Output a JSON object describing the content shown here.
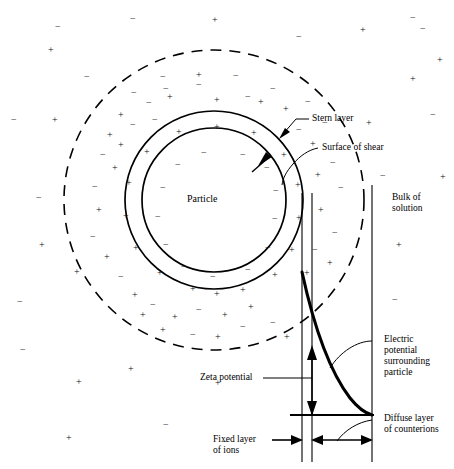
{
  "diagram": {
    "type": "schematic",
    "colors": {
      "stroke": "#000000",
      "background": "#ffffff",
      "text": "#000000"
    },
    "geometry": {
      "center": {
        "x": 214,
        "y": 200
      },
      "particle_radius": 72,
      "stern_radius": 89,
      "diffuse_radius": 150,
      "baseline_y": 415,
      "surface_of_shear_x": 302,
      "stern_boundary_x": 312,
      "bulk_boundary_x": 372,
      "curve_top_y": 272
    }
  },
  "labels": {
    "particle": "Particle",
    "stern_layer": "Stern layer",
    "surface_of_shear": "Surface of shear",
    "bulk_of_solution_line1": "Bulk of",
    "bulk_of_solution_line2": "solution",
    "electric_potential_line1": "Electric",
    "electric_potential_line2": "potential",
    "electric_potential_line3": "surrounding",
    "electric_potential_line4": "particle",
    "zeta_potential": "Zeta potential",
    "diffuse_layer_line1": "Diffuse layer",
    "diffuse_layer_line2": "of counterions",
    "fixed_layer_line1": "Fixed layer",
    "fixed_layer_line2": "of ions"
  },
  "ions": {
    "positive_symbol": "+",
    "negative_symbol": "−",
    "inside_particle": [
      {
        "x": 201,
        "y": 148,
        "s": "-"
      },
      {
        "x": 240,
        "y": 150,
        "s": "-"
      },
      {
        "x": 175,
        "y": 160,
        "s": "-"
      },
      {
        "x": 264,
        "y": 163,
        "s": "-"
      },
      {
        "x": 160,
        "y": 183,
        "s": "-"
      },
      {
        "x": 273,
        "y": 186,
        "s": "-"
      },
      {
        "x": 155,
        "y": 212,
        "s": "-"
      },
      {
        "x": 272,
        "y": 214,
        "s": "-"
      },
      {
        "x": 163,
        "y": 240,
        "s": "-"
      },
      {
        "x": 265,
        "y": 243,
        "s": "-"
      },
      {
        "x": 181,
        "y": 262,
        "s": "-"
      },
      {
        "x": 245,
        "y": 265,
        "s": "-"
      },
      {
        "x": 210,
        "y": 272,
        "s": "-"
      }
    ],
    "stern_shell": [
      {
        "x": 214,
        "y": 122,
        "s": "+"
      },
      {
        "x": 176,
        "y": 127,
        "s": "+"
      },
      {
        "x": 251,
        "y": 128,
        "s": "+"
      },
      {
        "x": 144,
        "y": 147,
        "s": "+"
      },
      {
        "x": 281,
        "y": 150,
        "s": "+"
      },
      {
        "x": 126,
        "y": 178,
        "s": "+"
      },
      {
        "x": 295,
        "y": 180,
        "s": "+"
      },
      {
        "x": 123,
        "y": 211,
        "s": "+"
      },
      {
        "x": 296,
        "y": 213,
        "s": "+"
      },
      {
        "x": 133,
        "y": 243,
        "s": "+"
      },
      {
        "x": 289,
        "y": 245,
        "s": "+"
      },
      {
        "x": 157,
        "y": 268,
        "s": "+"
      },
      {
        "x": 272,
        "y": 270,
        "s": "+"
      },
      {
        "x": 190,
        "y": 284,
        "s": "+"
      },
      {
        "x": 240,
        "y": 285,
        "s": "+"
      },
      {
        "x": 214,
        "y": 289,
        "s": "+"
      }
    ],
    "diffuse_layer": [
      {
        "x": 160,
        "y": 72,
        "s": "-"
      },
      {
        "x": 196,
        "y": 70,
        "s": "+"
      },
      {
        "x": 233,
        "y": 71,
        "s": "-"
      },
      {
        "x": 131,
        "y": 88,
        "s": "-"
      },
      {
        "x": 163,
        "y": 84,
        "s": "-"
      },
      {
        "x": 196,
        "y": 80,
        "s": "-"
      },
      {
        "x": 214,
        "y": 95,
        "s": "+"
      },
      {
        "x": 245,
        "y": 92,
        "s": "-"
      },
      {
        "x": 270,
        "y": 84,
        "s": "-"
      },
      {
        "x": 118,
        "y": 110,
        "s": "+"
      },
      {
        "x": 146,
        "y": 98,
        "s": "-"
      },
      {
        "x": 167,
        "y": 92,
        "s": "+"
      },
      {
        "x": 258,
        "y": 97,
        "s": "+"
      },
      {
        "x": 283,
        "y": 104,
        "s": "+"
      },
      {
        "x": 305,
        "y": 97,
        "s": "-"
      },
      {
        "x": 107,
        "y": 130,
        "s": "+"
      },
      {
        "x": 130,
        "y": 120,
        "s": "-"
      },
      {
        "x": 152,
        "y": 115,
        "s": "-"
      },
      {
        "x": 296,
        "y": 125,
        "s": "-"
      },
      {
        "x": 310,
        "y": 139,
        "s": "+"
      },
      {
        "x": 322,
        "y": 118,
        "s": "-"
      },
      {
        "x": 100,
        "y": 150,
        "s": "-"
      },
      {
        "x": 112,
        "y": 163,
        "s": "+"
      },
      {
        "x": 118,
        "y": 140,
        "s": "+"
      },
      {
        "x": 315,
        "y": 170,
        "s": "+"
      },
      {
        "x": 330,
        "y": 158,
        "s": "-"
      },
      {
        "x": 338,
        "y": 183,
        "s": "-"
      },
      {
        "x": 92,
        "y": 182,
        "s": "-"
      },
      {
        "x": 96,
        "y": 205,
        "s": "+"
      },
      {
        "x": 90,
        "y": 232,
        "s": "-"
      },
      {
        "x": 318,
        "y": 205,
        "s": "+"
      },
      {
        "x": 332,
        "y": 228,
        "s": "-"
      },
      {
        "x": 312,
        "y": 245,
        "s": "-"
      },
      {
        "x": 104,
        "y": 252,
        "s": "+"
      },
      {
        "x": 118,
        "y": 272,
        "s": "-"
      },
      {
        "x": 132,
        "y": 290,
        "s": "+"
      },
      {
        "x": 304,
        "y": 268,
        "s": "+"
      },
      {
        "x": 327,
        "y": 258,
        "s": "+"
      },
      {
        "x": 150,
        "y": 300,
        "s": "-"
      },
      {
        "x": 172,
        "y": 312,
        "s": "+"
      },
      {
        "x": 196,
        "y": 305,
        "s": "-"
      },
      {
        "x": 222,
        "y": 310,
        "s": "+"
      },
      {
        "x": 248,
        "y": 302,
        "s": "+"
      },
      {
        "x": 270,
        "y": 318,
        "s": "-"
      },
      {
        "x": 160,
        "y": 325,
        "s": "+"
      },
      {
        "x": 190,
        "y": 330,
        "s": "-"
      },
      {
        "x": 215,
        "y": 332,
        "s": "+"
      },
      {
        "x": 240,
        "y": 322,
        "s": "-"
      },
      {
        "x": 284,
        "y": 332,
        "s": "+"
      },
      {
        "x": 140,
        "y": 310,
        "s": "+"
      }
    ],
    "bulk_solution": [
      {
        "x": 55,
        "y": 22,
        "s": "-"
      },
      {
        "x": 48,
        "y": 45,
        "s": "+"
      },
      {
        "x": 130,
        "y": 14,
        "s": "-"
      },
      {
        "x": 212,
        "y": 15,
        "s": "+"
      },
      {
        "x": 296,
        "y": 32,
        "s": "-"
      },
      {
        "x": 360,
        "y": 25,
        "s": "+"
      },
      {
        "x": 420,
        "y": 24,
        "s": "-"
      },
      {
        "x": 437,
        "y": 55,
        "s": "+"
      },
      {
        "x": 11,
        "y": 115,
        "s": "-"
      },
      {
        "x": 52,
        "y": 115,
        "s": "+"
      },
      {
        "x": 84,
        "y": 72,
        "s": "-"
      },
      {
        "x": 410,
        "y": 74,
        "s": "+"
      },
      {
        "x": 366,
        "y": 118,
        "s": "+"
      },
      {
        "x": 430,
        "y": 110,
        "s": "-"
      },
      {
        "x": 380,
        "y": 171,
        "s": "-"
      },
      {
        "x": 440,
        "y": 172,
        "s": "+"
      },
      {
        "x": 36,
        "y": 193,
        "s": "-"
      },
      {
        "x": 39,
        "y": 240,
        "s": "+"
      },
      {
        "x": 396,
        "y": 240,
        "s": "+"
      },
      {
        "x": 392,
        "y": 295,
        "s": "-"
      },
      {
        "x": 17,
        "y": 297,
        "s": "-"
      },
      {
        "x": 74,
        "y": 267,
        "s": "+"
      },
      {
        "x": 128,
        "y": 364,
        "s": "+"
      },
      {
        "x": 76,
        "y": 377,
        "s": "+"
      },
      {
        "x": 215,
        "y": 378,
        "s": "+"
      },
      {
        "x": 163,
        "y": 420,
        "s": "-"
      },
      {
        "x": 66,
        "y": 433,
        "s": "+"
      },
      {
        "x": 222,
        "y": 437,
        "s": "-"
      },
      {
        "x": 20,
        "y": 345,
        "s": "-"
      },
      {
        "x": 410,
        "y": 13,
        "s": "-"
      }
    ]
  }
}
